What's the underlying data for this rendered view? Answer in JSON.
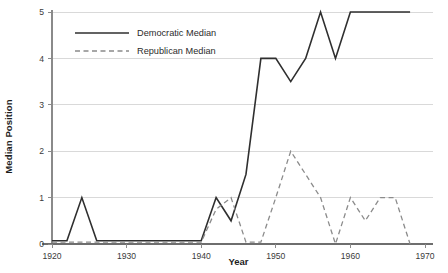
{
  "chart_data": {
    "type": "line",
    "title": "",
    "xlabel": "Year",
    "ylabel": "Median Position",
    "xlim": [
      1920,
      1970
    ],
    "ylim": [
      0,
      5
    ],
    "grid": true,
    "legend_position": "top-left",
    "x_ticks": [
      1920,
      1930,
      1940,
      1950,
      1960,
      1970
    ],
    "y_ticks": [
      0,
      1,
      2,
      3,
      4,
      5
    ],
    "series": [
      {
        "name": "Democratic Median",
        "style": "solid",
        "color": "#2f2f2f",
        "x": [
          1920,
          1922,
          1924,
          1926,
          1928,
          1930,
          1932,
          1934,
          1936,
          1938,
          1940,
          1942,
          1944,
          1946,
          1948,
          1950,
          1952,
          1954,
          1956,
          1958,
          1960,
          1962,
          1964,
          1966,
          1968
        ],
        "y": [
          0.07,
          0.07,
          1,
          0.07,
          0.07,
          0.07,
          0.07,
          0.07,
          0.07,
          0.07,
          0.07,
          1,
          0.5,
          1.5,
          4,
          4,
          3.5,
          4,
          5,
          4,
          5,
          5,
          5,
          5,
          5
        ]
      },
      {
        "name": "Republican Median",
        "style": "dashed",
        "color": "#8b8b8b",
        "x": [
          1920,
          1922,
          1924,
          1926,
          1928,
          1930,
          1932,
          1934,
          1936,
          1938,
          1940,
          1942,
          1944,
          1946,
          1948,
          1950,
          1952,
          1954,
          1956,
          1958,
          1960,
          1962,
          1964,
          1966,
          1968
        ],
        "y": [
          0.04,
          0.04,
          0.04,
          0.04,
          0.04,
          0.04,
          0.04,
          0.04,
          0.04,
          0.04,
          0.04,
          0.75,
          1,
          0.04,
          0.04,
          1,
          2,
          1.5,
          1,
          0,
          1,
          0.5,
          1,
          1,
          0
        ]
      }
    ]
  },
  "legend": {
    "items": [
      {
        "label": "Democratic Median",
        "style": "solid"
      },
      {
        "label": "Republican Median",
        "style": "dashed"
      }
    ]
  },
  "axes": {
    "x_title": "Year",
    "y_title": "Median Position",
    "x_tick_labels": [
      "1920",
      "1930",
      "1940",
      "1950",
      "1960",
      "1970"
    ],
    "y_tick_labels": [
      "0",
      "1",
      "2",
      "3",
      "4",
      "5"
    ]
  },
  "colors": {
    "democratic": "#2f2f2f",
    "republican": "#8b8b8b",
    "grid": "#d9d9d9",
    "axis": "#8a8a8a",
    "text": "#2b2b2b"
  }
}
